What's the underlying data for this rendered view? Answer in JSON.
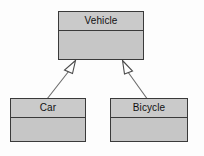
{
  "diagram": {
    "kind": "uml-class-diagram",
    "background_color": "#fdfdfd",
    "box_fill_color": "#c9c9c9",
    "box_border_color": "#3a3a3a",
    "shadow_color": "#9a9a9a",
    "line_color": "#6b6b6b",
    "classes": [
      {
        "id": "vehicle",
        "name": "Vehicle",
        "role": "superclass",
        "attributes": [],
        "operations": []
      },
      {
        "id": "car",
        "name": "Car",
        "role": "subclass",
        "attributes": [],
        "operations": []
      },
      {
        "id": "bicycle",
        "name": "Bicycle",
        "role": "subclass",
        "attributes": [],
        "operations": []
      }
    ],
    "relationships": [
      {
        "id": "car-to-vehicle",
        "type": "generalization",
        "from": "Car",
        "to": "Vehicle",
        "arrow": "hollow-triangle"
      },
      {
        "id": "bicycle-to-vehicle",
        "type": "generalization",
        "from": "Bicycle",
        "to": "Vehicle",
        "arrow": "hollow-triangle"
      }
    ]
  }
}
